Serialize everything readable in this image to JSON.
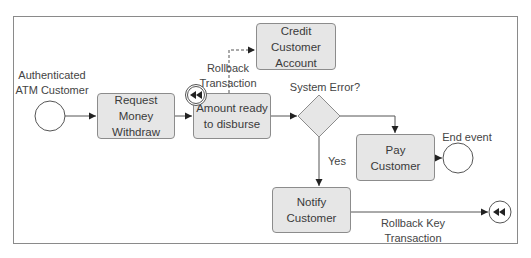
{
  "diagram": {
    "type": "bpmn-process",
    "start_event": {
      "label": "Authenticated\nATM Customer"
    },
    "tasks": [
      {
        "id": "request",
        "label": "Request Money\nWithdraw"
      },
      {
        "id": "amount",
        "label": "Amount ready\nto disburse"
      },
      {
        "id": "credit",
        "label": "Credit Customer\nAccount"
      },
      {
        "id": "pay",
        "label": "Pay\nCustomer"
      },
      {
        "id": "notify",
        "label": "Notify\nCustomer"
      }
    ],
    "gateway": {
      "label": "System Error?",
      "yes_label": "Yes"
    },
    "boundary_event": {
      "label": "Rollback\nTransaction",
      "icon": "rewind-icon"
    },
    "end_event": {
      "label": "End event"
    },
    "rollback_end_event": {
      "label": "Rollback Key\nTransaction",
      "icon": "rewind-icon"
    },
    "colors": {
      "task_fill": "#e6e6e6",
      "stroke": "#8c8c8c",
      "line": "#555555",
      "arrow": "#222222"
    }
  }
}
